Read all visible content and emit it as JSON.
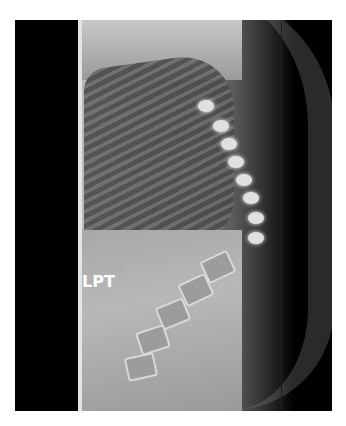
{
  "image": {
    "type": "lateral spine radiograph",
    "label": "LPT",
    "background": "#000000",
    "frame": {
      "left": 15,
      "top": 20,
      "width": 317,
      "height": 391
    }
  }
}
